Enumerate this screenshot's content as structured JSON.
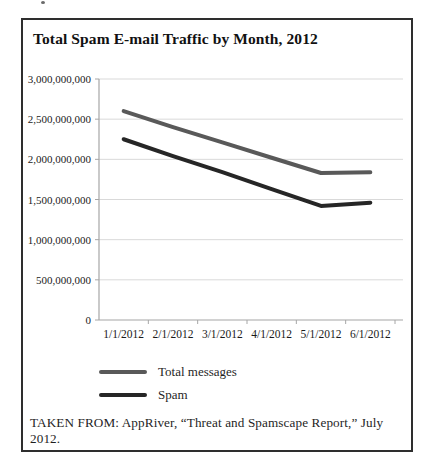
{
  "figure": {
    "title": "Total Spam E-mail Traffic by Month, 2012",
    "source": "TAKEN FROM: AppRiver, “Threat and Spamscape Report,” July 2012."
  },
  "chart_data": {
    "type": "line",
    "title": "Total Spam E-mail Traffic by Month, 2012",
    "x": [
      "1/1/2012",
      "2/1/2012",
      "3/1/2012",
      "4/1/2012",
      "5/1/2012",
      "6/1/2012"
    ],
    "series": [
      {
        "name": "Total messages",
        "color": "#595959",
        "values": [
          2600000000,
          2400000000,
          2210000000,
          2020000000,
          1830000000,
          1840000000
        ]
      },
      {
        "name": "Spam",
        "color": "#262626",
        "values": [
          2250000000,
          2040000000,
          1840000000,
          1630000000,
          1420000000,
          1460000000
        ]
      }
    ],
    "yticks": [
      {
        "v": 0,
        "label": "0"
      },
      {
        "v": 500000000,
        "label": "500,000,000"
      },
      {
        "v": 1000000000,
        "label": "1,000,000,000"
      },
      {
        "v": 1500000000,
        "label": "1,500,000,000"
      },
      {
        "v": 2000000000,
        "label": "2,000,000,000"
      },
      {
        "v": 2500000000,
        "label": "2,500,000,000"
      },
      {
        "v": 3000000000,
        "label": "3,000,000,000"
      }
    ],
    "ylim": [
      0,
      3000000000
    ],
    "xlabel": "",
    "ylabel": "",
    "grid": true,
    "legend_position": "bottom-left",
    "colors": {
      "grid": "#d9d9d9",
      "axis": "#a6a6a6",
      "tick_text": "#1a1a1a"
    }
  }
}
